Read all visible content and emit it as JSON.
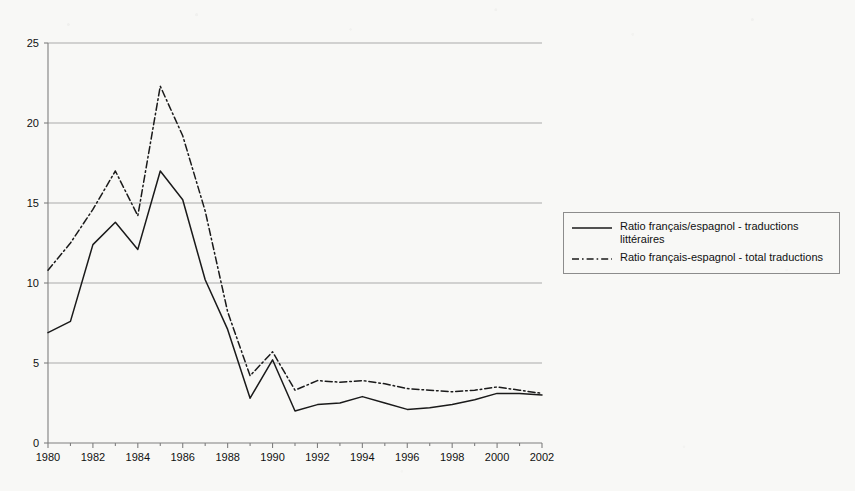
{
  "chart_data": {
    "type": "line",
    "title": "",
    "subtitle": "",
    "xlabel": "",
    "ylabel": "",
    "xlim": [
      1980,
      2002
    ],
    "ylim": [
      0,
      25
    ],
    "yticks": [
      0,
      5,
      10,
      15,
      20,
      25
    ],
    "ytick_labels": [
      "0",
      "5",
      "10",
      "15",
      "20",
      "25"
    ],
    "xticks": [
      1980,
      1982,
      1984,
      1986,
      1988,
      1990,
      1992,
      1994,
      1996,
      1998,
      2000,
      2002
    ],
    "xtick_labels": [
      "1980",
      "1982",
      "1984",
      "1986",
      "1988",
      "1990",
      "1992",
      "1994",
      "1996",
      "1998",
      "2000",
      "2002"
    ],
    "minor_xticks_every": 1,
    "grid": "horizontal",
    "legend_position": "right",
    "x": [
      1980,
      1981,
      1982,
      1983,
      1984,
      1985,
      1986,
      1987,
      1988,
      1989,
      1990,
      1991,
      1992,
      1993,
      1994,
      1995,
      1996,
      1997,
      1998,
      1999,
      2000,
      2001,
      2002
    ],
    "series": [
      {
        "name": "Ratio français/espagnol - traductions littéraires",
        "style": "solid",
        "color": "#1a1a1a",
        "values": [
          6.9,
          7.6,
          12.4,
          13.8,
          12.1,
          17.0,
          15.2,
          10.2,
          7.1,
          2.8,
          5.2,
          2.0,
          2.4,
          2.5,
          2.9,
          2.5,
          2.1,
          2.2,
          2.4,
          2.7,
          3.1,
          3.1,
          3.0
        ]
      },
      {
        "name": "Ratio français-espagnol - total traductions",
        "style": "dash-dot",
        "color": "#1a1a1a",
        "values": [
          10.8,
          12.5,
          14.6,
          17.0,
          14.2,
          22.3,
          19.2,
          14.5,
          8.2,
          4.2,
          5.7,
          3.3,
          3.9,
          3.8,
          3.9,
          3.7,
          3.4,
          3.3,
          3.2,
          3.3,
          3.5,
          3.3,
          3.1
        ]
      }
    ]
  },
  "legend": {
    "entries": [
      {
        "label": "Ratio français/espagnol - traductions\nlittéraires",
        "style": "solid"
      },
      {
        "label": "Ratio français-espagnol - total traductions",
        "style": "dash-dot"
      }
    ]
  },
  "colors": {
    "background": "#f8f8f6",
    "axis": "#7f7f7f",
    "grid": "#aaaaaa",
    "series": "#1a1a1a",
    "text": "#111111",
    "legend_border": "#8c8c8c"
  }
}
